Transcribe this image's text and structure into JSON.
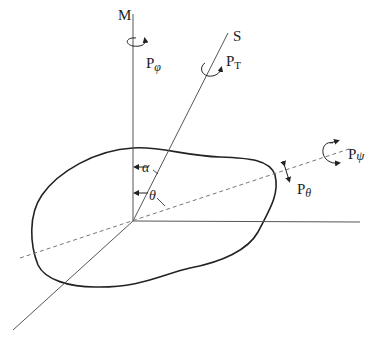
{
  "diagram": {
    "axes": {
      "m_label": "M",
      "s_label": "S"
    },
    "labels": {
      "p_phi": {
        "base": "P",
        "sub": "φ"
      },
      "p_t": {
        "base": "P",
        "sub": "T"
      },
      "p_psi": {
        "base": "P",
        "sub": "ψ"
      },
      "p_theta": {
        "base": "P",
        "sub": "θ"
      }
    },
    "angles": {
      "alpha": "α",
      "theta": "θ"
    },
    "colors": {
      "outline": "#222222",
      "axis": "#555555",
      "dashed": "#777777"
    }
  }
}
